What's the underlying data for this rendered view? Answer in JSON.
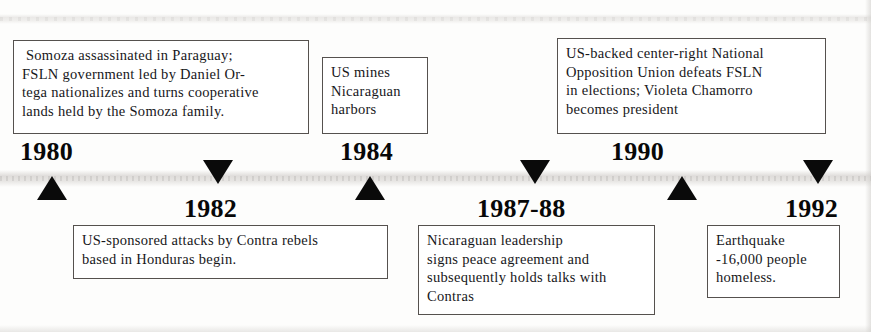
{
  "document": {
    "type": "timeline",
    "subject": "Nicaragua 1980-1992",
    "orientation": "horizontal",
    "axis_y": 178,
    "colors": {
      "background": "#fdfdfc",
      "box_border": "#55514e",
      "text": "#17171a",
      "year_text": "#080808",
      "marker_fill": "#0a0a0a"
    }
  },
  "events": [
    {
      "year": "1980",
      "row": "top",
      "marker": "up",
      "lines": [
        " Somoza assassinated in Paraguay;",
        "FSLN government led by Daniel Or-",
        "tega nationalizes and turns cooperative",
        "lands held by the Somoza family."
      ]
    },
    {
      "year": "1982",
      "row": "bottom",
      "marker": "down",
      "lines": [
        "US-sponsored attacks by Contra rebels",
        "based in Honduras begin."
      ]
    },
    {
      "year": "1984",
      "row": "top",
      "marker": "up",
      "lines": [
        "US mines",
        "Nicaraguan",
        "harbors"
      ]
    },
    {
      "year": "1987-88",
      "row": "bottom",
      "marker": "down",
      "lines": [
        "Nicaraguan leadership",
        "signs peace agreement and",
        "subsequently holds talks with",
        "Contras"
      ]
    },
    {
      "year": "1990",
      "row": "top",
      "marker": "up",
      "lines": [
        "US-backed center-right National",
        "Opposition Union defeats FSLN",
        "in elections; Violeta Chamorro",
        "becomes president"
      ]
    },
    {
      "year": "1992",
      "row": "bottom",
      "marker": "down",
      "lines": [
        "Earthquake",
        "-16,000 people",
        "homeless."
      ]
    }
  ]
}
